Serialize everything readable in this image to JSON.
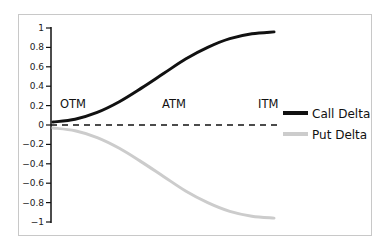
{
  "chart_data": {
    "type": "line",
    "title": "",
    "xlabel": "",
    "ylabel": "",
    "ylim": [
      -1,
      1
    ],
    "y_ticks": [
      1,
      0.8,
      0.6,
      0.4,
      0.2,
      0,
      -0.2,
      -0.4,
      -0.6,
      -0.8,
      -1
    ],
    "y_tick_labels": [
      "1",
      "0.8",
      "0.6",
      "0.4",
      "0.2",
      "0",
      "−0.2",
      "−0.4",
      "−0.6",
      "−0.8",
      "−1"
    ],
    "grid": false,
    "legend_position": "right",
    "x": [
      0,
      0.1,
      0.2,
      0.3,
      0.4,
      0.5,
      0.6,
      0.7,
      0.8,
      0.9,
      1.0
    ],
    "series": [
      {
        "name": "Call Delta",
        "color": "#111111",
        "values": [
          0.03,
          0.06,
          0.13,
          0.24,
          0.38,
          0.53,
          0.68,
          0.8,
          0.89,
          0.94,
          0.96
        ]
      },
      {
        "name": "Put Delta",
        "color": "#cccccc",
        "values": [
          -0.03,
          -0.06,
          -0.13,
          -0.24,
          -0.38,
          -0.53,
          -0.68,
          -0.8,
          -0.89,
          -0.94,
          -0.96
        ]
      }
    ],
    "annotations": [
      {
        "text": "OTM",
        "x": 0.1,
        "y": 0.22
      },
      {
        "text": "ATM",
        "x": 0.5,
        "y": 0.22
      },
      {
        "text": "ITM",
        "x": 0.95,
        "y": 0.22
      }
    ],
    "reference_line": {
      "y": 0,
      "style": "dashed",
      "color": "#111111"
    }
  },
  "legend": {
    "call_label": "Call Delta",
    "put_label": "Put Delta"
  },
  "labels": {
    "otm": "OTM",
    "atm": "ATM",
    "itm": "ITM"
  }
}
